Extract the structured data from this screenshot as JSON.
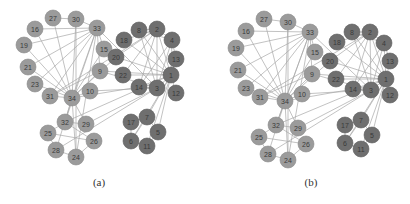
{
  "figure": {
    "panels": [
      {
        "id": "a",
        "caption": "(a)",
        "caption_x": 99,
        "nodes": {
          "1": [
            171,
            75,
            "dark"
          ],
          "2": [
            157,
            29,
            "dark"
          ],
          "3": [
            157,
            88,
            "dark"
          ],
          "4": [
            172,
            40,
            "dark"
          ],
          "5": [
            158,
            132,
            "dark"
          ],
          "6": [
            131,
            141,
            "dark"
          ],
          "7": [
            147,
            117,
            "dark"
          ],
          "8": [
            139,
            30,
            "dark"
          ],
          "9": [
            100,
            71,
            "light"
          ],
          "10": [
            90,
            91,
            "light"
          ],
          "11": [
            147,
            146,
            "dark"
          ],
          "12": [
            176,
            93,
            "dark"
          ],
          "13": [
            176,
            59,
            "dark"
          ],
          "14": [
            139,
            87,
            "dark"
          ],
          "15": [
            104,
            49,
            "light"
          ],
          "16": [
            35,
            29,
            "light"
          ],
          "17": [
            131,
            122,
            "dark"
          ],
          "18": [
            124,
            40,
            "dark"
          ],
          "19": [
            24,
            45,
            "light"
          ],
          "20": [
            116,
            57,
            "dark"
          ],
          "21": [
            28,
            67,
            "light"
          ],
          "22": [
            123,
            75,
            "dark"
          ],
          "23": [
            35,
            84,
            "light"
          ],
          "24": [
            76,
            157,
            "light"
          ],
          "25": [
            48,
            133,
            "light"
          ],
          "26": [
            94,
            141,
            "light"
          ],
          "27": [
            53,
            18,
            "light"
          ],
          "28": [
            56,
            150,
            "light"
          ],
          "29": [
            86,
            124,
            "light"
          ],
          "30": [
            76,
            19,
            "light"
          ],
          "31": [
            50,
            96,
            "light"
          ],
          "32": [
            65,
            122,
            "light"
          ],
          "33": [
            97,
            28,
            "light"
          ],
          "34": [
            72,
            98,
            "light"
          ]
        }
      },
      {
        "id": "b",
        "caption": "(b)",
        "caption_x": 311,
        "nodes": {
          "1": [
            386,
            79,
            "dark"
          ],
          "2": [
            370,
            32,
            "dark"
          ],
          "3": [
            371,
            90,
            "dark"
          ],
          "4": [
            384,
            43,
            "dark"
          ],
          "5": [
            372,
            135,
            "dark"
          ],
          "6": [
            345,
            143,
            "dark"
          ],
          "7": [
            361,
            120,
            "dark"
          ],
          "8": [
            352,
            32,
            "dark"
          ],
          "9": [
            312,
            74,
            "light"
          ],
          "10": [
            302,
            94,
            "light"
          ],
          "11": [
            361,
            149,
            "dark"
          ],
          "12": [
            390,
            95,
            "dark"
          ],
          "13": [
            390,
            61,
            "dark"
          ],
          "14": [
            353,
            89,
            "dark"
          ],
          "15": [
            315,
            52,
            "light"
          ],
          "16": [
            246,
            31,
            "light"
          ],
          "17": [
            345,
            125,
            "dark"
          ],
          "18": [
            337,
            42,
            "dark"
          ],
          "19": [
            236,
            48,
            "light"
          ],
          "20": [
            330,
            61,
            "dark"
          ],
          "21": [
            238,
            70,
            "light"
          ],
          "22": [
            336,
            79,
            "dark"
          ],
          "23": [
            246,
            88,
            "light"
          ],
          "24": [
            288,
            160,
            "light"
          ],
          "25": [
            259,
            137,
            "light"
          ],
          "26": [
            306,
            144,
            "light"
          ],
          "27": [
            264,
            19,
            "light"
          ],
          "28": [
            268,
            154,
            "light"
          ],
          "29": [
            298,
            128,
            "light"
          ],
          "30": [
            288,
            22,
            "light"
          ],
          "31": [
            260,
            97,
            "light"
          ],
          "32": [
            276,
            125,
            "light"
          ],
          "33": [
            310,
            32,
            "light"
          ],
          "34": [
            285,
            101,
            "light"
          ]
        }
      }
    ],
    "edges": [
      [
        1,
        2
      ],
      [
        1,
        3
      ],
      [
        1,
        4
      ],
      [
        1,
        5
      ],
      [
        1,
        6
      ],
      [
        1,
        7
      ],
      [
        1,
        8
      ],
      [
        1,
        9
      ],
      [
        1,
        11
      ],
      [
        1,
        12
      ],
      [
        1,
        13
      ],
      [
        1,
        14
      ],
      [
        1,
        18
      ],
      [
        1,
        20
      ],
      [
        1,
        22
      ],
      [
        1,
        32
      ],
      [
        2,
        3
      ],
      [
        2,
        4
      ],
      [
        2,
        8
      ],
      [
        2,
        14
      ],
      [
        2,
        18
      ],
      [
        2,
        20
      ],
      [
        2,
        22
      ],
      [
        2,
        31
      ],
      [
        3,
        4
      ],
      [
        3,
        8
      ],
      [
        3,
        9
      ],
      [
        3,
        10
      ],
      [
        3,
        14
      ],
      [
        3,
        28
      ],
      [
        3,
        29
      ],
      [
        3,
        33
      ],
      [
        4,
        8
      ],
      [
        4,
        13
      ],
      [
        4,
        14
      ],
      [
        5,
        7
      ],
      [
        5,
        11
      ],
      [
        6,
        7
      ],
      [
        6,
        11
      ],
      [
        6,
        17
      ],
      [
        7,
        17
      ],
      [
        9,
        31
      ],
      [
        9,
        33
      ],
      [
        9,
        34
      ],
      [
        10,
        34
      ],
      [
        14,
        34
      ],
      [
        15,
        33
      ],
      [
        15,
        34
      ],
      [
        16,
        33
      ],
      [
        16,
        34
      ],
      [
        19,
        33
      ],
      [
        19,
        34
      ],
      [
        20,
        34
      ],
      [
        21,
        33
      ],
      [
        21,
        34
      ],
      [
        23,
        33
      ],
      [
        23,
        34
      ],
      [
        24,
        26
      ],
      [
        24,
        28
      ],
      [
        24,
        30
      ],
      [
        24,
        33
      ],
      [
        24,
        34
      ],
      [
        25,
        26
      ],
      [
        25,
        28
      ],
      [
        25,
        32
      ],
      [
        26,
        32
      ],
      [
        27,
        30
      ],
      [
        27,
        34
      ],
      [
        28,
        34
      ],
      [
        29,
        32
      ],
      [
        29,
        34
      ],
      [
        30,
        33
      ],
      [
        30,
        34
      ],
      [
        31,
        33
      ],
      [
        31,
        34
      ],
      [
        32,
        33
      ],
      [
        32,
        34
      ],
      [
        33,
        34
      ]
    ],
    "style": {
      "node_radius": 8,
      "dark_fill": "#6f6f6f",
      "light_fill": "#9b9b9b",
      "edge_color": "#a8a8a8",
      "label_color": "#3a3a3a"
    }
  }
}
